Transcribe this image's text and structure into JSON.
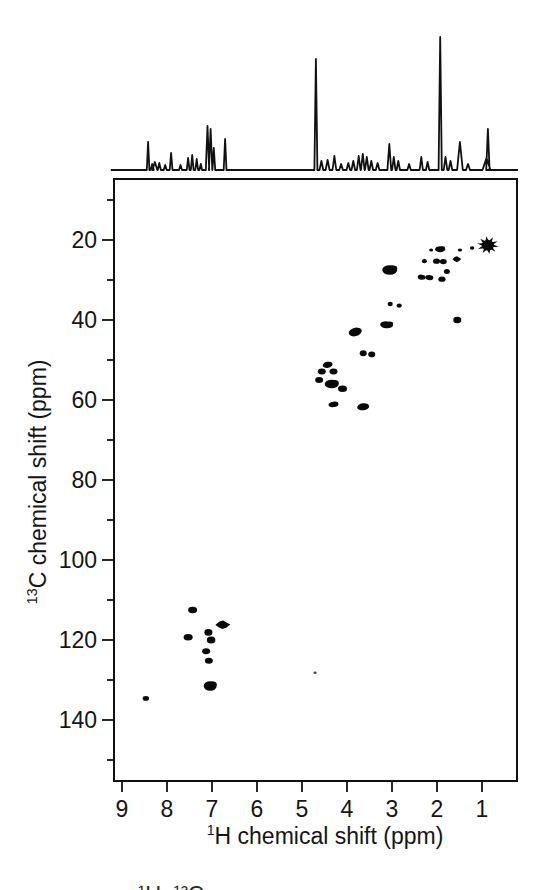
{
  "figure": {
    "background": "#ffffff",
    "ink_color": "#111111"
  },
  "chart_data": {
    "type": "scatter",
    "title": "",
    "xlabel_sup": "1",
    "xlabel_text": "H chemical shift (ppm)",
    "ylabel_sup": "13",
    "ylabel_text": "C chemical shift (ppm)",
    "x_axis": {
      "unit": "ppm",
      "range_left_to_right": [
        9.2,
        0.2
      ],
      "reversed": true,
      "major_ticks": [
        9,
        8,
        7,
        6,
        5,
        4,
        3,
        2,
        1
      ]
    },
    "y_axis": {
      "unit": "ppm",
      "range_top_to_bottom": [
        4.5,
        155.5
      ],
      "increases_downward": true,
      "major_ticks": [
        20,
        40,
        60,
        80,
        100,
        120,
        140
      ],
      "minor_ticks": [
        10,
        30,
        50,
        70,
        90,
        110,
        130,
        150
      ]
    },
    "grid": false,
    "legend": false,
    "peaks_2d": [
      {
        "h": 8.47,
        "c": 134.6,
        "rx": 3.2,
        "ry": 2.3
      },
      {
        "h": 7.53,
        "c": 119.3,
        "rx": 4.5,
        "ry": 3.2
      },
      {
        "h": 7.43,
        "c": 112.5,
        "rx": 4.5,
        "ry": 3.3
      },
      {
        "h": 7.13,
        "c": 122.8,
        "rx": 4.0,
        "ry": 3.0
      },
      {
        "h": 7.08,
        "c": 118.1,
        "rx": 4.0,
        "ry": 3.3
      },
      {
        "h": 7.07,
        "c": 125.2,
        "rx": 4.0,
        "ry": 3.0
      },
      {
        "h": 7.04,
        "c": 131.5,
        "rx": 6.5,
        "ry": 4.8,
        "s": "blob"
      },
      {
        "h": 7.02,
        "c": 120.0,
        "rx": 4.3,
        "ry": 3.5
      },
      {
        "h": 6.76,
        "c": 116.2,
        "rx": 7.5,
        "ry": 4.3,
        "s": "diamond"
      },
      {
        "h": 4.71,
        "c": 128.2,
        "rx": 1.6,
        "ry": 1.2,
        "f": "#4a4a4a"
      },
      {
        "h": 4.62,
        "c": 55.0,
        "rx": 4.0,
        "ry": 3.0
      },
      {
        "h": 4.56,
        "c": 52.9,
        "rx": 4.0,
        "ry": 3.0
      },
      {
        "h": 4.43,
        "c": 51.2,
        "rx": 5.0,
        "ry": 3.0,
        "rot": -12
      },
      {
        "h": 4.34,
        "c": 56.0,
        "rx": 7.0,
        "ry": 4.3,
        "s": "blob"
      },
      {
        "h": 4.3,
        "c": 52.9,
        "rx": 4.0,
        "ry": 3.0
      },
      {
        "h": 4.3,
        "c": 61.1,
        "rx": 5.0,
        "ry": 2.7,
        "rot": -8
      },
      {
        "h": 4.1,
        "c": 57.2,
        "rx": 4.5,
        "ry": 3.2
      },
      {
        "h": 3.82,
        "c": 43.0,
        "rx": 6.5,
        "ry": 4.2,
        "rot": -14,
        "s": "blob"
      },
      {
        "h": 3.64,
        "c": 48.3,
        "rx": 3.5,
        "ry": 3.0
      },
      {
        "h": 3.64,
        "c": 61.7,
        "rx": 6.0,
        "ry": 3.5,
        "rot": -8
      },
      {
        "h": 3.45,
        "c": 48.6,
        "rx": 3.5,
        "ry": 2.8
      },
      {
        "h": 3.12,
        "c": 41.2,
        "rx": 6.5,
        "ry": 3.4,
        "rot": 4,
        "s": "blob"
      },
      {
        "h": 3.05,
        "c": 27.5,
        "rx": 7.5,
        "ry": 4.8,
        "s": "blob"
      },
      {
        "h": 3.04,
        "c": 36.0,
        "rx": 2.6,
        "ry": 2.2
      },
      {
        "h": 2.84,
        "c": 36.4,
        "rx": 2.6,
        "ry": 2.2
      },
      {
        "h": 2.34,
        "c": 29.3,
        "rx": 4.0,
        "ry": 2.5,
        "rot": 8
      },
      {
        "h": 2.28,
        "c": 25.3,
        "rx": 2.5,
        "ry": 2.1
      },
      {
        "h": 2.17,
        "c": 29.4,
        "rx": 4.0,
        "ry": 2.5,
        "rot": 8
      },
      {
        "h": 2.13,
        "c": 22.5,
        "rx": 2.0,
        "ry": 1.6
      },
      {
        "h": 2.01,
        "c": 25.3,
        "rx": 3.5,
        "ry": 2.6
      },
      {
        "h": 1.93,
        "c": 22.3,
        "rx": 5.0,
        "ry": 3.0,
        "s": "blob"
      },
      {
        "h": 1.89,
        "c": 29.8,
        "rx": 3.6,
        "ry": 2.6
      },
      {
        "h": 1.86,
        "c": 25.4,
        "rx": 3.5,
        "ry": 2.6
      },
      {
        "h": 1.78,
        "c": 27.9,
        "rx": 3.0,
        "ry": 2.5
      },
      {
        "h": 1.56,
        "c": 24.8,
        "rx": 4.5,
        "ry": 3.0,
        "s": "diamond"
      },
      {
        "h": 1.55,
        "c": 40.0,
        "rx": 4.0,
        "ry": 3.3
      },
      {
        "h": 1.49,
        "c": 22.5,
        "rx": 2.2,
        "ry": 1.6
      },
      {
        "h": 1.22,
        "c": 22.0,
        "rx": 2.2,
        "ry": 1.7
      },
      {
        "h": 0.87,
        "c": 21.3,
        "rx": 11.0,
        "ry": 9.0,
        "s": "star"
      }
    ],
    "trace_1d": {
      "baseline_span_ppm": [
        9.25,
        0.2
      ],
      "peaks": [
        [
          8.42,
          28,
          1.3
        ],
        [
          8.33,
          6,
          1.6
        ],
        [
          8.27,
          8,
          2.4
        ],
        [
          8.17,
          7,
          1.6
        ],
        [
          8.04,
          5,
          1.5
        ],
        [
          7.91,
          17,
          1.4
        ],
        [
          7.7,
          5,
          1.5
        ],
        [
          7.53,
          12,
          1.4
        ],
        [
          7.44,
          15,
          1.4
        ],
        [
          7.34,
          11,
          1.4
        ],
        [
          7.25,
          6,
          1.3
        ],
        [
          7.1,
          44,
          1.7
        ],
        [
          7.03,
          41,
          1.7
        ],
        [
          6.96,
          22,
          1.4
        ],
        [
          6.71,
          31,
          1.4
        ],
        [
          4.69,
          111,
          1.5
        ],
        [
          4.57,
          9,
          1.9
        ],
        [
          4.43,
          10,
          2.0
        ],
        [
          4.28,
          14,
          1.9
        ],
        [
          4.13,
          6,
          1.8
        ],
        [
          3.97,
          7,
          1.8
        ],
        [
          3.86,
          9,
          1.8
        ],
        [
          3.74,
          14,
          1.8
        ],
        [
          3.65,
          16,
          1.8
        ],
        [
          3.56,
          13,
          1.8
        ],
        [
          3.46,
          9,
          1.8
        ],
        [
          3.32,
          7,
          1.8
        ],
        [
          3.06,
          26,
          1.9
        ],
        [
          2.96,
          13,
          1.7
        ],
        [
          2.86,
          9,
          1.7
        ],
        [
          2.62,
          6,
          1.7
        ],
        [
          2.35,
          13,
          1.7
        ],
        [
          2.21,
          8,
          1.7
        ],
        [
          1.93,
          133,
          1.6
        ],
        [
          1.81,
          13,
          1.8
        ],
        [
          1.7,
          9,
          1.8
        ],
        [
          1.49,
          28,
          2.8
        ],
        [
          1.31,
          6,
          2.0
        ],
        [
          0.9,
          12,
          4.0
        ],
        [
          0.87,
          41,
          1.7
        ]
      ]
    },
    "caption_fragment": "¹H–¹³C"
  }
}
